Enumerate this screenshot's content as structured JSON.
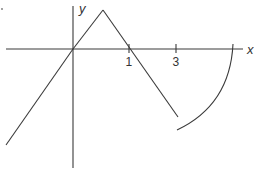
{
  "figure": {
    "axes": {
      "x_label": "x",
      "y_label": "y"
    },
    "ticks": [
      {
        "label": "1",
        "x": 129
      },
      {
        "label": "3",
        "x": 176
      }
    ],
    "colors": {
      "line": "#3a3a3a",
      "background": "#ffffff"
    },
    "segments": [
      {
        "name": "left-ray",
        "description": "line from lower-left through the origin"
      },
      {
        "name": "rising-segment",
        "description": "origin up to peak"
      },
      {
        "name": "falling-segment",
        "description": "peak down through x=1 to open endpoint"
      },
      {
        "name": "arc",
        "description": "curved piece starting near x=3 below axis, rising to cross x-axis at right"
      }
    ]
  }
}
